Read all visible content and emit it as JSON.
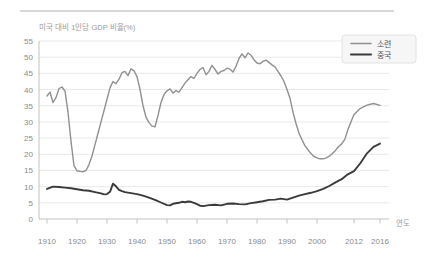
{
  "chart_data": {
    "type": "line",
    "title": "미국 대비 1인당 GDP 비율(%)",
    "xlabel": "연도",
    "ylabel": "",
    "ylim": [
      0,
      55
    ],
    "xlim": [
      1910,
      2016
    ],
    "y_ticks": [
      0,
      5,
      10,
      15,
      20,
      25,
      30,
      35,
      40,
      45,
      50,
      55
    ],
    "x_ticks": [
      1910,
      1920,
      1930,
      1940,
      1950,
      1960,
      1970,
      1980,
      1990,
      2000,
      2012,
      2016
    ],
    "grid": "horizontal-only",
    "legend_position": "top-right-inside",
    "colors": {
      "soviet_line": "#909090",
      "china_line": "#3a3a3a",
      "gridline": "#e9e9e9",
      "axis": "#c2c2c2",
      "tick_label": "#8a8a8a",
      "title_text": "#9a9a9a",
      "legend_text": "#555555",
      "legend_bg": "#f6f6f6",
      "legend_border": "#e2e2e2",
      "divider": "#b3b3b3",
      "background": "#ffffff"
    },
    "series": [
      {
        "name": "소련",
        "color_key": "soviet_line",
        "stroke_width": 1.4,
        "points": [
          [
            1910,
            38
          ],
          [
            1911,
            39.2
          ],
          [
            1912,
            36
          ],
          [
            1913,
            37.5
          ],
          [
            1914,
            40.3
          ],
          [
            1915,
            40.8
          ],
          [
            1916,
            39.5
          ],
          [
            1917,
            33
          ],
          [
            1918,
            24
          ],
          [
            1919,
            16.5
          ],
          [
            1920,
            14.9
          ],
          [
            1921,
            14.7
          ],
          [
            1922,
            14.6
          ],
          [
            1923,
            15
          ],
          [
            1924,
            16.8
          ],
          [
            1925,
            19.5
          ],
          [
            1926,
            23
          ],
          [
            1927,
            26.5
          ],
          [
            1928,
            30
          ],
          [
            1929,
            33.5
          ],
          [
            1930,
            37
          ],
          [
            1931,
            40.5
          ],
          [
            1932,
            42.5
          ],
          [
            1933,
            41.8
          ],
          [
            1934,
            43.2
          ],
          [
            1935,
            45.2
          ],
          [
            1936,
            45.6
          ],
          [
            1937,
            44.3
          ],
          [
            1938,
            46.4
          ],
          [
            1939,
            45.8
          ],
          [
            1940,
            44
          ],
          [
            1941,
            40
          ],
          [
            1942,
            35
          ],
          [
            1943,
            31.5
          ],
          [
            1944,
            29.8
          ],
          [
            1945,
            28.7
          ],
          [
            1946,
            28.5
          ],
          [
            1947,
            32
          ],
          [
            1948,
            36
          ],
          [
            1949,
            38.5
          ],
          [
            1950,
            39.6
          ],
          [
            1951,
            40.2
          ],
          [
            1952,
            38.9
          ],
          [
            1953,
            39.7
          ],
          [
            1954,
            39.2
          ],
          [
            1955,
            40.6
          ],
          [
            1956,
            42
          ],
          [
            1957,
            43
          ],
          [
            1958,
            44
          ],
          [
            1959,
            43.4
          ],
          [
            1960,
            45
          ],
          [
            1961,
            46.2
          ],
          [
            1962,
            46.8
          ],
          [
            1963,
            44.6
          ],
          [
            1964,
            45.6
          ],
          [
            1965,
            47.5
          ],
          [
            1966,
            46.2
          ],
          [
            1967,
            44.8
          ],
          [
            1968,
            45.6
          ],
          [
            1969,
            45.9
          ],
          [
            1970,
            46.6
          ],
          [
            1971,
            46.3
          ],
          [
            1972,
            45.4
          ],
          [
            1973,
            47.2
          ],
          [
            1974,
            49.6
          ],
          [
            1975,
            51
          ],
          [
            1976,
            49.8
          ],
          [
            1977,
            51.3
          ],
          [
            1978,
            50.6
          ],
          [
            1979,
            49.2
          ],
          [
            1980,
            48.2
          ],
          [
            1981,
            48
          ],
          [
            1982,
            48.7
          ],
          [
            1983,
            49.1
          ],
          [
            1984,
            48.4
          ],
          [
            1985,
            47.6
          ],
          [
            1986,
            47
          ],
          [
            1987,
            45.6
          ],
          [
            1988,
            44.2
          ],
          [
            1989,
            42.5
          ],
          [
            1990,
            40
          ],
          [
            1991,
            37.3
          ],
          [
            1992,
            33
          ],
          [
            1993,
            29.5
          ],
          [
            1994,
            26.5
          ],
          [
            1995,
            24.5
          ],
          [
            1996,
            22.6
          ],
          [
            1997,
            21.4
          ],
          [
            1998,
            20.2
          ],
          [
            1999,
            19.3
          ],
          [
            2000,
            18.9
          ],
          [
            2001,
            18.6
          ],
          [
            2002,
            18.6
          ],
          [
            2003,
            18.9
          ],
          [
            2004,
            19.4
          ],
          [
            2005,
            20.2
          ],
          [
            2006,
            21.2
          ],
          [
            2007,
            22.4
          ],
          [
            2008,
            23.2
          ],
          [
            2009,
            24.6
          ],
          [
            2010,
            27.5
          ],
          [
            2011,
            30
          ],
          [
            2012,
            32.3
          ],
          [
            2013,
            34.2
          ],
          [
            2014,
            35.2
          ],
          [
            2015,
            35.7
          ],
          [
            2016,
            35.1
          ]
        ]
      },
      {
        "name": "중국",
        "color_key": "china_line",
        "stroke_width": 1.9,
        "points": [
          [
            1910,
            9.3
          ],
          [
            1912,
            10
          ],
          [
            1914,
            9.9
          ],
          [
            1916,
            9.7
          ],
          [
            1918,
            9.5
          ],
          [
            1920,
            9.2
          ],
          [
            1922,
            8.9
          ],
          [
            1924,
            8.7
          ],
          [
            1926,
            8.3
          ],
          [
            1928,
            7.9
          ],
          [
            1929,
            7.6
          ],
          [
            1930,
            7.7
          ],
          [
            1931,
            8.4
          ],
          [
            1932,
            10.9
          ],
          [
            1933,
            10.1
          ],
          [
            1934,
            9
          ],
          [
            1935,
            8.6
          ],
          [
            1936,
            8.3
          ],
          [
            1938,
            8
          ],
          [
            1940,
            7.7
          ],
          [
            1942,
            7.2
          ],
          [
            1944,
            6.6
          ],
          [
            1946,
            5.9
          ],
          [
            1948,
            5.1
          ],
          [
            1950,
            4.3
          ],
          [
            1951,
            4.2
          ],
          [
            1952,
            4.7
          ],
          [
            1954,
            5
          ],
          [
            1955,
            5.3
          ],
          [
            1956,
            5.2
          ],
          [
            1957,
            5.4
          ],
          [
            1958,
            5.3
          ],
          [
            1959,
            5
          ],
          [
            1960,
            4.6
          ],
          [
            1961,
            4.1
          ],
          [
            1962,
            4
          ],
          [
            1964,
            4.3
          ],
          [
            1966,
            4.4
          ],
          [
            1968,
            4.2
          ],
          [
            1970,
            4.7
          ],
          [
            1972,
            4.8
          ],
          [
            1974,
            4.6
          ],
          [
            1976,
            4.5
          ],
          [
            1978,
            4.9
          ],
          [
            1980,
            5.2
          ],
          [
            1982,
            5.5
          ],
          [
            1984,
            5.9
          ],
          [
            1986,
            6
          ],
          [
            1988,
            6.3
          ],
          [
            1990,
            6
          ],
          [
            1992,
            6.6
          ],
          [
            1994,
            7.2
          ],
          [
            1996,
            7.7
          ],
          [
            1998,
            8.1
          ],
          [
            2000,
            8.6
          ],
          [
            2002,
            9.3
          ],
          [
            2004,
            10.2
          ],
          [
            2006,
            11.3
          ],
          [
            2008,
            12.3
          ],
          [
            2010,
            13.8
          ],
          [
            2012,
            14.8
          ],
          [
            2013,
            17.3
          ],
          [
            2014,
            20.3
          ],
          [
            2015,
            22.3
          ],
          [
            2016,
            23.3
          ]
        ]
      }
    ]
  }
}
